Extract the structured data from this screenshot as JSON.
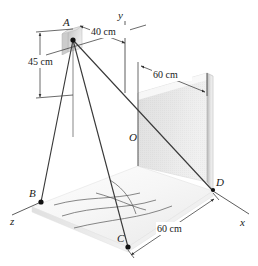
{
  "figure": {
    "title": "",
    "type": "engineering-3d-diagram"
  },
  "axes": {
    "x_label": "x",
    "y_label": "y",
    "z_label": "z",
    "origin_label": "O"
  },
  "points": [
    {
      "id": "A",
      "label": "A"
    },
    {
      "id": "B",
      "label": "B"
    },
    {
      "id": "C",
      "label": "C"
    },
    {
      "id": "D",
      "label": "D"
    },
    {
      "id": "O",
      "label": "O"
    }
  ],
  "dimensions": [
    {
      "id": "height-a",
      "value": "45 cm",
      "orientation": "vertical-left"
    },
    {
      "id": "offset-a",
      "value": "40 cm",
      "orientation": "diagonal-top"
    },
    {
      "id": "plate-width",
      "value": "60 cm",
      "orientation": "diagonal-upper-right"
    },
    {
      "id": "ground-depth",
      "value": "60 cm",
      "orientation": "diagonal-lower-right"
    }
  ],
  "colors": {
    "line": "#3a3a3a",
    "axis": "#4a4a4a",
    "node": "#111111",
    "plate_light": "#f2f2f2",
    "plate_dark": "#d2d2d2",
    "plate_edge": "#9a9a9a",
    "ground_light": "#fbfbfb",
    "ground_shade": "#ededed",
    "background": "#ffffff"
  }
}
